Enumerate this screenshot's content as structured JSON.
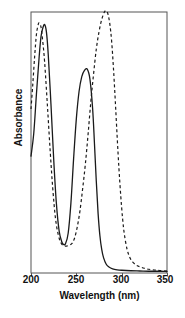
{
  "chart_data": {
    "type": "line",
    "title": "",
    "xlabel": "Wavelength (nm)",
    "ylabel": "Absorbance",
    "xlim": [
      200,
      350
    ],
    "ylim": [
      0,
      1.05
    ],
    "xticks": [
      200,
      250,
      300,
      350
    ],
    "xtick_labels": [
      "200",
      "250",
      "300",
      "350"
    ],
    "yticks": [],
    "ytick_labels": [],
    "grid": false,
    "legend": "none",
    "frame": "full-box",
    "series": [
      {
        "name": "solid",
        "style": "solid",
        "color": "#1a1a1a",
        "x": [
          200,
          203,
          206,
          209,
          211,
          213,
          215,
          217,
          219,
          222,
          225,
          228,
          231,
          234,
          236,
          238,
          241,
          244,
          247,
          250,
          253,
          256,
          259,
          262,
          265,
          268,
          270,
          272,
          274,
          276,
          278,
          280,
          283,
          286,
          290,
          295,
          300,
          310,
          320,
          330,
          340,
          350
        ],
        "y": [
          0.47,
          0.56,
          0.72,
          0.87,
          0.95,
          0.985,
          1.0,
          0.97,
          0.88,
          0.68,
          0.46,
          0.28,
          0.17,
          0.125,
          0.115,
          0.118,
          0.16,
          0.28,
          0.46,
          0.62,
          0.73,
          0.79,
          0.815,
          0.82,
          0.78,
          0.66,
          0.52,
          0.37,
          0.24,
          0.15,
          0.095,
          0.062,
          0.035,
          0.024,
          0.017,
          0.013,
          0.011,
          0.009,
          0.008,
          0.007,
          0.007,
          0.006
        ]
      },
      {
        "name": "dashed",
        "style": "dashed",
        "color": "#1a1a1a",
        "x": [
          200,
          202,
          204,
          206,
          208,
          209,
          211,
          213,
          215,
          218,
          221,
          224,
          227,
          230,
          233,
          236,
          239,
          242,
          245,
          248,
          251,
          254,
          257,
          260,
          263,
          266,
          269,
          272,
          275,
          278,
          281,
          283,
          285,
          287,
          289,
          291,
          293,
          295,
          297,
          299,
          301,
          303,
          306,
          309,
          312,
          316,
          320,
          325,
          330,
          336,
          342,
          350
        ],
        "y": [
          0.66,
          0.76,
          0.87,
          0.96,
          1.0,
          1.005,
          0.99,
          0.93,
          0.85,
          0.68,
          0.5,
          0.34,
          0.22,
          0.155,
          0.122,
          0.11,
          0.108,
          0.112,
          0.118,
          0.14,
          0.185,
          0.25,
          0.34,
          0.44,
          0.56,
          0.69,
          0.8,
          0.9,
          0.97,
          1.02,
          1.05,
          1.055,
          1.04,
          1.0,
          0.93,
          0.82,
          0.69,
          0.55,
          0.42,
          0.31,
          0.22,
          0.155,
          0.095,
          0.062,
          0.045,
          0.032,
          0.025,
          0.019,
          0.015,
          0.012,
          0.01,
          0.008
        ]
      }
    ]
  },
  "axis": {
    "y_label": "Absorbance",
    "x_label": "Wavelength (nm)",
    "x_tick_0": "200",
    "x_tick_1": "250",
    "x_tick_2": "300",
    "x_tick_3": "350"
  }
}
